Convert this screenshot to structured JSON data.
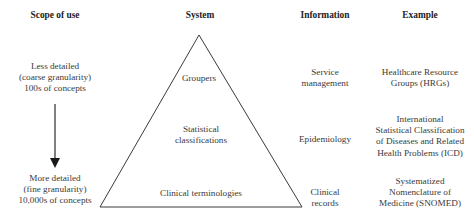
{
  "headers": {
    "scope": "Scope of use",
    "system": "System",
    "information": "Information",
    "example": "Example"
  },
  "scope": {
    "top": [
      "Less detailed",
      "(coarse granularity)",
      "100s of concepts"
    ],
    "bottom": [
      "More detailed",
      "(fine granularity)",
      "10,000s of concepts"
    ],
    "arrow_direction": "down"
  },
  "rows": [
    {
      "system": [
        "Groupers"
      ],
      "information": [
        "Service",
        "management"
      ],
      "example": [
        "Healthcare Resource",
        "Groups (HRGs)"
      ]
    },
    {
      "system": [
        "Statistical",
        "classifications"
      ],
      "information": [
        "Epidemiology"
      ],
      "example": [
        "International",
        "Statistical Classification",
        "of Diseases and Related",
        "Health Problems (ICD)"
      ]
    },
    {
      "system": [
        "Clinical terminologies"
      ],
      "information": [
        "Clinical",
        "records"
      ],
      "example": [
        "Systematized",
        "Nomenclature of",
        "Medicine (SNOMED)"
      ]
    }
  ],
  "shape": {
    "type": "triangle",
    "stroke": "#333333"
  }
}
